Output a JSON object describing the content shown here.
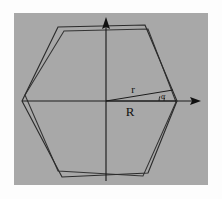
{
  "figure": {
    "background_color": "#ffffff",
    "panel_color": "#a8a8a8",
    "stroke_color": "#2b2b2b",
    "panel": {
      "x": 14,
      "y": 13,
      "width": 194,
      "height": 172
    },
    "center": {
      "x": 106,
      "y": 101
    }
  },
  "labels": {
    "inradius": "r",
    "circumradius": "R",
    "angle": "α"
  },
  "label_positions": {
    "inradius": {
      "x": 133,
      "y": 93
    },
    "circumradius": {
      "x": 130,
      "y": 116
    },
    "angle": {
      "x": 163,
      "y": 99
    }
  },
  "axes": {
    "horizontal": {
      "x1": 22,
      "y1": 101,
      "x2": 200,
      "y2": 101,
      "arrow": "right"
    },
    "vertical": {
      "x1": 106,
      "y1": 181,
      "x2": 106,
      "y2": 18,
      "arrow": "up"
    }
  },
  "geometry": {
    "hexagon_primary": [
      {
        "x": 22,
        "y": 101
      },
      {
        "x": 58,
        "y": 27
      },
      {
        "x": 145,
        "y": 25
      },
      {
        "x": 177,
        "y": 101
      },
      {
        "x": 148,
        "y": 173
      },
      {
        "x": 62,
        "y": 177
      }
    ],
    "hexagon_secondary": [
      {
        "x": 25,
        "y": 95
      },
      {
        "x": 64,
        "y": 31
      },
      {
        "x": 148,
        "y": 29
      },
      {
        "x": 176,
        "y": 102
      },
      {
        "x": 143,
        "y": 176
      },
      {
        "x": 58,
        "y": 171
      }
    ],
    "inradius_segment": {
      "x1": 106,
      "y1": 101,
      "x2": 173,
      "y2": 90
    },
    "circumradius_segment": {
      "x1": 106,
      "y1": 101,
      "x2": 176,
      "y2": 101
    },
    "angle_arc": {
      "cx": 176,
      "cy": 101,
      "radius": 13,
      "start_deg": 172,
      "end_deg": 180
    }
  }
}
